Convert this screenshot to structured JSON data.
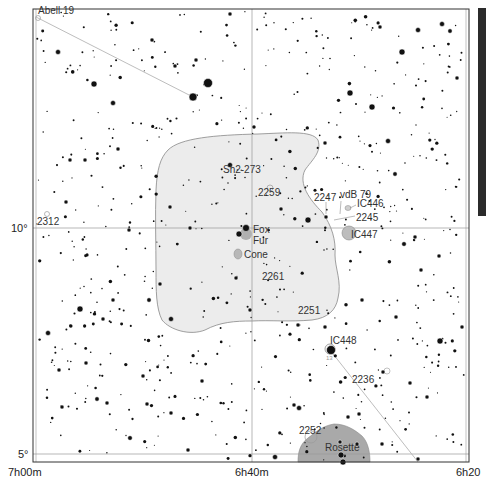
{
  "chart": {
    "frame": {
      "x0": 33,
      "y0": 9,
      "x1": 469,
      "y1": 462
    },
    "colors": {
      "background": "#ffffff",
      "star": "#111111",
      "nebula_fill_large": "#e8e8e8",
      "nebula_outline": "#888888",
      "nebula_fill_small": "#bcbcbc",
      "rosette_fill": "#a9a9a9",
      "grid": "#9a9a9a",
      "label": "#333333",
      "scale_bar": "#2b2b2b",
      "constellation_line": "#b0b0b0"
    },
    "grid": {
      "ra_lines": [
        {
          "label": "7h00m",
          "x": 33
        },
        {
          "label": "6h40m",
          "x": 252
        },
        {
          "label": "6h20",
          "x": 469
        }
      ],
      "dec_lines": [
        {
          "label": "10°",
          "y": 228
        },
        {
          "label": "5°",
          "y": 454
        }
      ]
    },
    "axis_labels": {
      "ra_left": "7h00m",
      "ra_mid": "6h40m",
      "ra_right": "6h20",
      "dec_10": "10°",
      "dec_5": "5°"
    },
    "objects": [
      {
        "name": "Abell 19",
        "x": 38,
        "y": 12,
        "type": "planetary"
      },
      {
        "name": "2312",
        "x": 37,
        "y": 224,
        "type": "open-cluster"
      },
      {
        "name": "Sh2-273",
        "x": 223,
        "y": 172,
        "type": "nebula"
      },
      {
        "name": "2259",
        "x": 258,
        "y": 196,
        "type": "open-cluster"
      },
      {
        "name": "2247",
        "x": 314,
        "y": 201,
        "type": "nebula"
      },
      {
        "name": "vdB 79",
        "x": 340,
        "y": 197,
        "type": "nebula"
      },
      {
        "name": "IC446",
        "x": 357,
        "y": 207,
        "type": "nebula"
      },
      {
        "name": "2245",
        "x": 356,
        "y": 220,
        "type": "nebula"
      },
      {
        "name": "IC447",
        "x": 351,
        "y": 238,
        "type": "nebula"
      },
      {
        "name": "Fox",
        "x": 252,
        "y": 232,
        "type": "nebula"
      },
      {
        "name": "Fur",
        "x": 252,
        "y": 244,
        "type": "nebula"
      },
      {
        "name": "Cone",
        "x": 244,
        "y": 258,
        "type": "nebula"
      },
      {
        "name": "2261",
        "x": 262,
        "y": 280,
        "type": "nebula"
      },
      {
        "name": "2251",
        "x": 298,
        "y": 313,
        "type": "open-cluster"
      },
      {
        "name": "IC448",
        "x": 330,
        "y": 344,
        "type": "nebula"
      },
      {
        "name": "13",
        "x": 326,
        "y": 358,
        "type": "star-label"
      },
      {
        "name": "2236",
        "x": 352,
        "y": 383,
        "type": "open-cluster"
      },
      {
        "name": "2252",
        "x": 299,
        "y": 435,
        "type": "open-cluster"
      },
      {
        "name": "Rosette",
        "x": 325,
        "y": 450,
        "type": "nebula"
      }
    ],
    "scale_bar": {
      "visible": true
    }
  }
}
